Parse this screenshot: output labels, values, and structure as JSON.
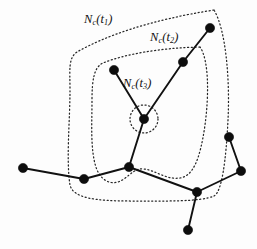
{
  "figure": {
    "width": 257,
    "height": 249,
    "background_color": "#fdfdfd",
    "ink_color": "#111111",
    "dotted_color": "#262626"
  },
  "labels": [
    {
      "id": "nc-t1",
      "base": "N",
      "sub_base": "c",
      "arg_open": "(",
      "arg": "t",
      "arg_sub": "1",
      "arg_close": ")",
      "text": "Nc(t1)",
      "x": 84,
      "y": 12
    },
    {
      "id": "nc-t2",
      "base": "N",
      "sub_base": "c",
      "arg_open": "(",
      "arg": "t",
      "arg_sub": "2",
      "arg_close": ")",
      "text": "Nc(t2)",
      "x": 150,
      "y": 30
    },
    {
      "id": "nc-t3",
      "base": "N",
      "sub_base": "c",
      "arg_open": "(",
      "arg": "t",
      "arg_sub": "3",
      "arg_close": ")",
      "text": "Nc(t3)",
      "x": 123,
      "y": 76
    }
  ],
  "chart_data": {
    "type": "diagram",
    "nodes": [
      {
        "id": "n1",
        "label": "top-right",
        "x": 210,
        "y": 28,
        "r": 4.6
      },
      {
        "id": "n2",
        "label": "upper-mid-right",
        "x": 183,
        "y": 62,
        "r": 4.6
      },
      {
        "id": "n3",
        "label": "upper-left-branch",
        "x": 114,
        "y": 70,
        "r": 4.6
      },
      {
        "id": "n4",
        "label": "center-hub",
        "x": 144,
        "y": 119,
        "r": 4.6
      },
      {
        "id": "n5",
        "label": "lower-center-hub",
        "x": 129,
        "y": 167,
        "r": 4.6
      },
      {
        "id": "n6",
        "label": "left-outer",
        "x": 23,
        "y": 168,
        "r": 4.6
      },
      {
        "id": "n7",
        "label": "left-mid",
        "x": 84,
        "y": 179,
        "r": 4.6
      },
      {
        "id": "n8",
        "label": "lower-right-hub",
        "x": 197,
        "y": 192,
        "r": 4.6
      },
      {
        "id": "n9",
        "label": "right-lower",
        "x": 241,
        "y": 171,
        "r": 4.6
      },
      {
        "id": "n10",
        "label": "right-upper",
        "x": 229,
        "y": 137,
        "r": 4.6
      },
      {
        "id": "n11",
        "label": "bottom",
        "x": 188,
        "y": 230,
        "r": 4.6
      }
    ],
    "edges": [
      {
        "from": "n1",
        "to": "n2"
      },
      {
        "from": "n2",
        "to": "n4"
      },
      {
        "from": "n3",
        "to": "n4"
      },
      {
        "from": "n4",
        "to": "n5"
      },
      {
        "from": "n5",
        "to": "n7"
      },
      {
        "from": "n7",
        "to": "n6"
      },
      {
        "from": "n5",
        "to": "n8"
      },
      {
        "from": "n8",
        "to": "n9"
      },
      {
        "from": "n9",
        "to": "n10"
      },
      {
        "from": "n8",
        "to": "n11"
      }
    ],
    "regions": [
      {
        "id": "region-t1",
        "label": "N_c(t1)",
        "style": "dotted",
        "path": "M 214 10 C 150 20, 105 36, 77 52 C 68 58, 70 70, 70 90 C 70 120, 66 160, 70 185 C 73 198, 95 201, 130 201 C 165 201, 200 202, 214 196 C 222 192, 226 160, 228 120 C 230 80, 226 30, 214 10 Z"
      },
      {
        "id": "region-t2",
        "label": "N_c(t2)",
        "style": "dotted",
        "path": "M 200 47 C 160 48, 125 54, 103 63 C 94 67, 92 80, 92 100 C 92 125, 90 152, 97 170 C 103 183, 114 186, 124 179 C 132 173, 136 168, 144 169 C 155 170, 166 180, 180 178 C 193 176, 200 160, 205 125 C 209 95, 209 60, 200 47 Z"
      },
      {
        "id": "region-t3",
        "label": "N_c(t3)",
        "style": "dotted",
        "path": "M 158 119 A 14 14 0 1 1 130 119 A 14 14 0 1 1 158 119 Z"
      }
    ]
  }
}
